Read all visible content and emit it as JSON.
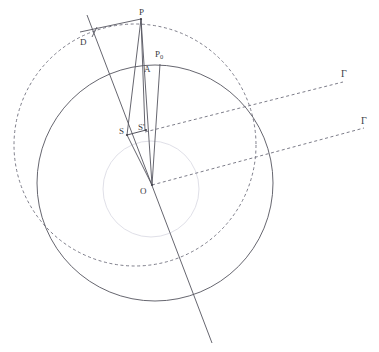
{
  "figure": {
    "width": 379,
    "height": 352,
    "background_color": "#ffffff",
    "stroke_color_solid": "#555560",
    "stroke_color_dashed": "#6a6a78",
    "stroke_color_faint": "#dcdce4",
    "label_color": "#3a3a42"
  },
  "labels": {
    "p": "P",
    "p0_base": "P",
    "p0_sub": "0",
    "d": "D",
    "a": "A",
    "s": "S",
    "s_prime": "S'",
    "o": "O",
    "gamma_upper": "Γ",
    "gamma_lower": "Γ"
  },
  "label_positions": {
    "p": {
      "x": 139,
      "y": 8
    },
    "p0": {
      "x": 155,
      "y": 50
    },
    "d": {
      "x": 80,
      "y": 38
    },
    "a": {
      "x": 144,
      "y": 65
    },
    "s": {
      "x": 119,
      "y": 127
    },
    "s_prime": {
      "x": 138,
      "y": 123
    },
    "o": {
      "x": 140,
      "y": 187
    },
    "gamma_upper": {
      "x": 341,
      "y": 70
    },
    "gamma_lower": {
      "x": 361,
      "y": 117
    }
  },
  "geometry": {
    "outer_solid_circle": {
      "cx": 155,
      "cy": 183,
      "r": 118,
      "style": "solid"
    },
    "dashed_circle": {
      "cx": 135,
      "cy": 145,
      "r": 121,
      "style": "dashed"
    },
    "faint_inner_circle": {
      "cx": 151,
      "cy": 189,
      "r": 48,
      "style": "faint"
    },
    "points": {
      "P": {
        "x": 141,
        "y": 19
      },
      "P0": {
        "x": 160,
        "y": 64
      },
      "D": {
        "x": 92,
        "y": 37
      },
      "A": {
        "x": 140,
        "y": 72
      },
      "S": {
        "x": 127,
        "y": 135
      },
      "S_prime": {
        "x": 145,
        "y": 131
      },
      "O": {
        "x": 152,
        "y": 185
      }
    },
    "lines": [
      {
        "name": "chord-P-to-D",
        "from": {
          "x": 141,
          "y": 19
        },
        "to": {
          "x": 80,
          "y": 32
        },
        "style": "solid"
      },
      {
        "name": "long-diagonal-through-S",
        "from": {
          "x": 87,
          "y": 15
        },
        "to": {
          "x": 212,
          "y": 343
        },
        "style": "solid"
      },
      {
        "name": "segment-P-to-S",
        "from": {
          "x": 141,
          "y": 19
        },
        "to": {
          "x": 127,
          "y": 135
        },
        "style": "solid"
      },
      {
        "name": "segment-P-to-S-prime",
        "from": {
          "x": 141,
          "y": 19
        },
        "to": {
          "x": 145,
          "y": 131
        },
        "style": "solid"
      },
      {
        "name": "segment-P-to-O",
        "from": {
          "x": 141,
          "y": 19
        },
        "to": {
          "x": 152,
          "y": 185
        },
        "style": "solid"
      },
      {
        "name": "segment-P0-to-O",
        "from": {
          "x": 160,
          "y": 64
        },
        "to": {
          "x": 152,
          "y": 185
        },
        "style": "solid"
      },
      {
        "name": "segment-S-to-S-prime",
        "from": {
          "x": 127,
          "y": 135
        },
        "to": {
          "x": 145,
          "y": 131
        },
        "style": "solid"
      },
      {
        "name": "segment-S-to-O",
        "from": {
          "x": 127,
          "y": 135
        },
        "to": {
          "x": 152,
          "y": 185
        },
        "style": "solid"
      },
      {
        "name": "segment-D-perpendicular",
        "from": {
          "x": 92,
          "y": 37
        },
        "to": {
          "x": 97,
          "y": 28
        },
        "style": "solid"
      },
      {
        "name": "ray-gamma-upper",
        "from": {
          "x": 145,
          "y": 132
        },
        "to": {
          "x": 343,
          "y": 82
        },
        "style": "dashed"
      },
      {
        "name": "ray-gamma-lower",
        "from": {
          "x": 152,
          "y": 185
        },
        "to": {
          "x": 364,
          "y": 128
        },
        "style": "dashed"
      }
    ]
  }
}
